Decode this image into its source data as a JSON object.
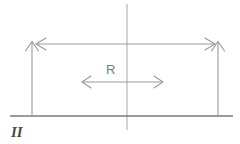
{
  "figure": {
    "title": "",
    "labels": {
      "radius": "R",
      "region": "II"
    },
    "colors": {
      "line": "#9a9a9a",
      "baseline": "#6e6e6e",
      "axis": "#aaaaaa",
      "text_radius": "#7a7a7a",
      "text_region": "#4a4a4a",
      "background": "#ffffff"
    },
    "geometry": {
      "width": 240,
      "height": 144,
      "center_axis_x": 127,
      "center_axis_y_top": 4,
      "center_axis_y_bottom": 130,
      "baseline_y": 116,
      "baseline_x_start": 10,
      "baseline_x_end": 233,
      "left_vertical_x": 32,
      "right_vertical_x": 218,
      "vertical_arrow_y_top": 41,
      "top_arrow_y": 44,
      "top_arrow_x_left": 36,
      "top_arrow_x_right": 215,
      "mid_arrow_y": 82,
      "mid_arrow_x_left": 82,
      "mid_arrow_x_right": 163
    }
  }
}
